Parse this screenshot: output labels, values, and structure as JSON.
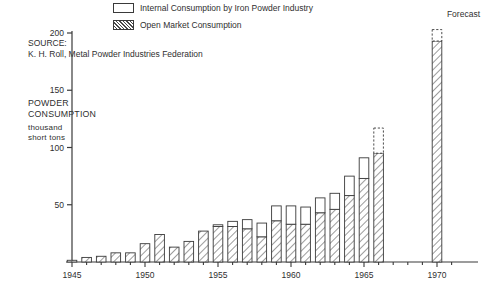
{
  "legend": {
    "items": [
      {
        "label": "Internal Consumption by Iron Powder Industry",
        "pattern": "solid-white",
        "name": "legend-internal"
      },
      {
        "label": "Open Market Consumption",
        "pattern": "hatched",
        "name": "legend-open-market"
      }
    ]
  },
  "annotations": {
    "source_heading": "SOURCE:",
    "source_text": "K. H. Roll, Metal Powder Industries Federation",
    "axis_title_line1": "POWDER",
    "axis_title_line2": "CONSUMPTION",
    "axis_sub_line1": "thousand",
    "axis_sub_line2": "short tons",
    "forecast_label": "Forecast"
  },
  "colors": {
    "ink": "#2f2f2f",
    "bar_outline": "#3a3a3a",
    "hatch": "#4a4a4a",
    "fill_white": "#ffffff"
  },
  "chart_data": {
    "type": "bar",
    "title": "",
    "subtitle": "",
    "xlabel": "",
    "ylabel": "POWDER CONSUMPTION thousand short tons",
    "ylim": [
      0,
      200
    ],
    "yticks": [
      0,
      50,
      100,
      150,
      200
    ],
    "ytick_labels": [
      "",
      "50",
      "100",
      "150",
      "200"
    ],
    "xlim": [
      1945,
      1971
    ],
    "xticks": [
      1945,
      1950,
      1955,
      1960,
      1965,
      1970
    ],
    "xtick_labels": [
      "1945",
      "1950",
      "1955",
      "1960",
      "1965",
      "1970"
    ],
    "minor_xticks_every": 1,
    "grid": false,
    "legend_position": "top-center",
    "stacked": true,
    "series": [
      {
        "name": "Open Market Consumption",
        "pattern": "hatched",
        "values": [
          1.5,
          4,
          5,
          8,
          8,
          16,
          24,
          13,
          18,
          27,
          31,
          31,
          29,
          22,
          36,
          33,
          33,
          43,
          46,
          58,
          73,
          95,
          null,
          null,
          null,
          193
        ]
      },
      {
        "name": "Internal Consumption by Iron Powder Industry",
        "pattern": "solid-white",
        "values": [
          0,
          0,
          0,
          0,
          0,
          0,
          0,
          0,
          0,
          0,
          1.5,
          4.5,
          8,
          12,
          13,
          16,
          15,
          13,
          14,
          17,
          18,
          22,
          null,
          null,
          null,
          10
        ]
      }
    ],
    "categories": [
      1945,
      1946,
      1947,
      1948,
      1949,
      1950,
      1951,
      1952,
      1953,
      1954,
      1955,
      1956,
      1957,
      1958,
      1959,
      1960,
      1961,
      1962,
      1963,
      1964,
      1965,
      1966,
      1967,
      1968,
      1969,
      1970
    ],
    "totals": [
      1.5,
      4,
      5,
      8,
      8,
      16,
      24,
      13,
      18,
      27,
      32.5,
      35.5,
      37,
      34,
      49,
      49,
      48,
      56,
      60,
      75,
      91,
      117,
      null,
      null,
      null,
      203
    ],
    "dashed_top_years": [
      1966,
      1970
    ]
  }
}
